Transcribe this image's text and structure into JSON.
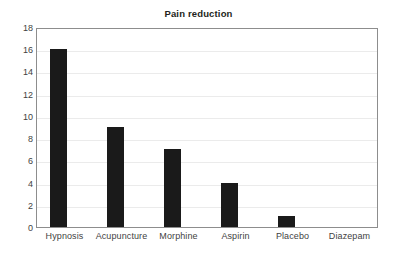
{
  "chart_data": {
    "type": "bar",
    "title": "Pain reduction",
    "xlabel": "",
    "ylabel": "",
    "categories": [
      "Hypnosis",
      "Acupuncture",
      "Morphine",
      "Aspirin",
      "Placebo",
      "Diazepam"
    ],
    "values": [
      16,
      9,
      7,
      4,
      1,
      0
    ],
    "ylim": [
      0,
      18
    ],
    "ytick_step": 2,
    "yticks": [
      0,
      2,
      4,
      6,
      8,
      10,
      12,
      14,
      16,
      18
    ],
    "grid": true,
    "legend": null,
    "bar_color": "#1a1a1a",
    "grid_color": "#ebebeb",
    "frame_color": "#8d8d8d",
    "text_color": "#3f3f3f",
    "title_color": "#231f20"
  }
}
